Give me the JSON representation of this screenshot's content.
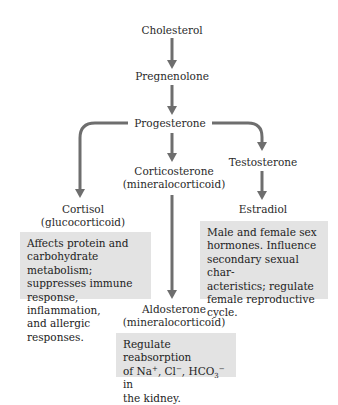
{
  "diagram": {
    "type": "steroid-hormone-biosynthesis-pathway",
    "arrow_color": "#6e6e6e",
    "box_color": "#e3e3e3",
    "nodes": {
      "cholesterol": {
        "name": "Cholesterol"
      },
      "pregnenolone": {
        "name": "Pregnenolone"
      },
      "progesterone": {
        "name": "Progesterone"
      },
      "corticosterone": {
        "name": "Corticosterone",
        "class": "(mineralocorticoid)"
      },
      "testosterone": {
        "name": "Testosterone"
      },
      "cortisol": {
        "name": "Cortisol",
        "class": "(glucocorticoid)"
      },
      "estradiol": {
        "name": "Estradiol"
      },
      "aldosterone": {
        "name": "Aldosterone",
        "class": "(mineralocorticoid)"
      }
    },
    "descriptions": {
      "cortisol": [
        "Affects protein and",
        "carbohydrate metabolism;",
        "suppresses immune",
        "response, inflammation,",
        "and allergic responses."
      ],
      "sex_hormones": [
        "Male and female sex",
        "hormones. Influence",
        "secondary sexual char-",
        "acteristics; regulate",
        "female reproductive",
        "cycle."
      ],
      "aldosterone": {
        "line1": "Regulate reabsorption",
        "line2_prefix": "of Na",
        "na_sup": "+",
        "sep1": ", Cl",
        "cl_sup": "−",
        "sep2": ", HCO",
        "hco_sub": "3",
        "hco_sup": "−",
        "line2_suffix": " in",
        "line3": "the kidney."
      }
    },
    "edges": [
      [
        "Cholesterol",
        "Pregnenolone"
      ],
      [
        "Pregnenolone",
        "Progesterone"
      ],
      [
        "Progesterone",
        "Cortisol"
      ],
      [
        "Progesterone",
        "Corticosterone"
      ],
      [
        "Progesterone",
        "Testosterone"
      ],
      [
        "Testosterone",
        "Estradiol"
      ],
      [
        "Corticosterone",
        "Aldosterone"
      ]
    ]
  }
}
